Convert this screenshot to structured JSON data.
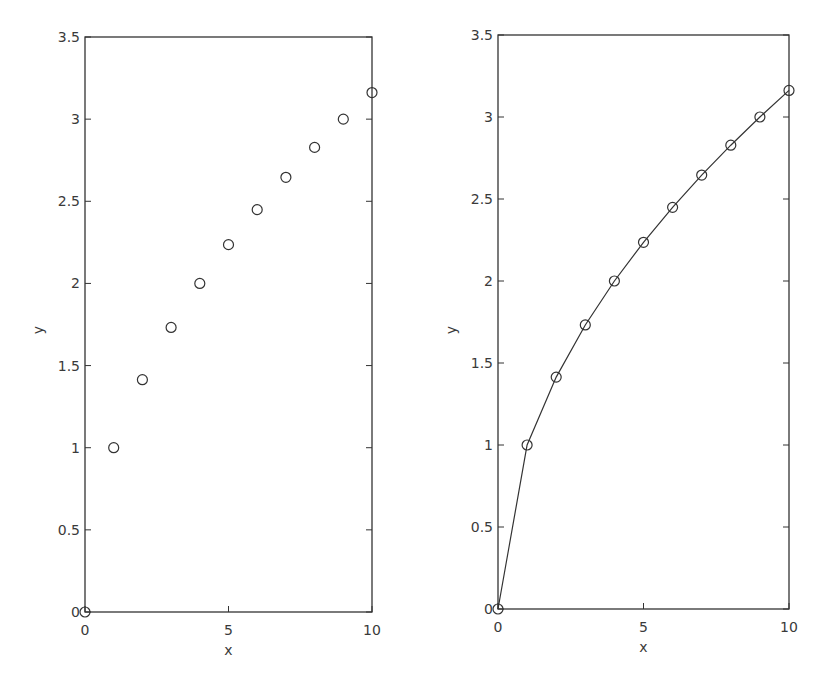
{
  "chart_data": [
    {
      "type": "scatter",
      "title": "",
      "xlabel": "x",
      "ylabel": "y",
      "xlim": [
        0,
        10
      ],
      "ylim": [
        0,
        3.5
      ],
      "xticks": [
        0,
        5,
        10
      ],
      "yticks": [
        0,
        0.5,
        1,
        1.5,
        2,
        2.5,
        3,
        3.5
      ],
      "xtick_labels": [
        "0",
        "5",
        "10"
      ],
      "ytick_labels": [
        "0",
        "0.5",
        "1",
        "1.5",
        "2",
        "2.5",
        "3",
        "3.5"
      ],
      "grid": false,
      "legend": null,
      "series": [
        {
          "name": "sqrt(x) samples",
          "marker": "circle-open",
          "line": false,
          "x": [
            0,
            1,
            2,
            3,
            4,
            5,
            6,
            7,
            8,
            9,
            10
          ],
          "y": [
            0,
            1,
            1.414,
            1.732,
            2,
            2.236,
            2.449,
            2.646,
            2.828,
            3,
            3.162
          ]
        }
      ]
    },
    {
      "type": "line",
      "title": "",
      "xlabel": "x",
      "ylabel": "y",
      "xlim": [
        0,
        10
      ],
      "ylim": [
        0,
        3.5
      ],
      "xticks": [
        0,
        5,
        10
      ],
      "yticks": [
        0,
        0.5,
        1,
        1.5,
        2,
        2.5,
        3,
        3.5
      ],
      "xtick_labels": [
        "0",
        "5",
        "10"
      ],
      "ytick_labels": [
        "0",
        "0.5",
        "1",
        "1.5",
        "2",
        "2.5",
        "3",
        "3.5"
      ],
      "grid": false,
      "legend": null,
      "series": [
        {
          "name": "sqrt(x) samples with line",
          "marker": "circle-open",
          "line": true,
          "x": [
            0,
            1,
            2,
            3,
            4,
            5,
            6,
            7,
            8,
            9,
            10
          ],
          "y": [
            0,
            1,
            1.414,
            1.732,
            2,
            2.236,
            2.449,
            2.646,
            2.828,
            3,
            3.162
          ]
        }
      ]
    }
  ],
  "colors": {
    "axis": "#333333",
    "marker": "#333333",
    "line": "#333333",
    "background": "#ffffff"
  }
}
